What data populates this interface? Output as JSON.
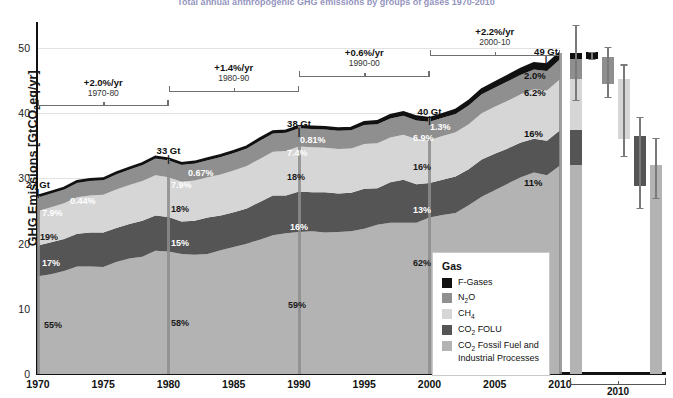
{
  "title": "Total annual anthropogenic GHG emissions by groups of gases 1970-2010",
  "axes": {
    "ylabel": "GHG Emissions [GtCO2eq/yr]",
    "ylabel_prefix": "GHG Emissions [GtCO",
    "ylabel_sub": "2",
    "ylabel_suffix": "eq/yr]",
    "yticks": [
      0,
      10,
      20,
      30,
      40,
      50
    ],
    "ylim": [
      0,
      54
    ],
    "xticks": [
      "1970",
      "1975",
      "1980",
      "1985",
      "1990",
      "1995",
      "2000",
      "2005",
      "2010"
    ],
    "xlim": [
      1970,
      2010
    ]
  },
  "legend": {
    "title": "Gas",
    "items": [
      {
        "label": "F-Gases",
        "sub": "",
        "tail": "",
        "color": "#111111"
      },
      {
        "label": "N",
        "sub": "2",
        "tail": "O",
        "color": "#8f8f8f"
      },
      {
        "label": "CH",
        "sub": "4",
        "tail": "",
        "color": "#d6d6d6"
      },
      {
        "label": "CO",
        "sub": "2",
        "tail": " FOLU",
        "color": "#555555"
      },
      {
        "label": "CO",
        "sub": "2",
        "tail": " Fossil Fuel and Industrial Processes",
        "color": "#b3b3b3"
      }
    ]
  },
  "growth_brackets": [
    {
      "rate": "+2.0%/yr",
      "period": "1970-80",
      "x0": 1970,
      "x1": 1980
    },
    {
      "rate": "+1.4%/yr",
      "period": "1980-90",
      "x0": 1980,
      "x1": 1990
    },
    {
      "rate": "+0.6%/yr",
      "period": "1990-00",
      "x0": 1990,
      "x1": 2000
    },
    {
      "rate": "+2.2%/yr",
      "period": "2000-10",
      "x0": 2000,
      "x1": 2010
    }
  ],
  "milestones": [
    {
      "year": 1970,
      "total": "27 Gt",
      "shares": [
        "7.9%",
        "19%",
        "17%",
        "55%"
      ],
      "extra": "0.44%"
    },
    {
      "year": 1980,
      "total": "33 Gt",
      "shares": [
        "7.9%",
        "18%",
        "15%",
        "58%"
      ],
      "extra": "0.67%"
    },
    {
      "year": 1990,
      "total": "38 Gt",
      "shares": [
        "7.4%",
        "18%",
        "16%",
        "59%"
      ],
      "extra": "0.81%"
    },
    {
      "year": 2000,
      "total": "40 Gt",
      "shares": [
        "6.9%",
        "16%",
        "13%",
        "62%"
      ],
      "extra": "1.3%"
    },
    {
      "year": 2010,
      "total": "49 Gt",
      "shares": [
        "6.2%",
        "16%",
        "11%",
        "65%"
      ],
      "extra": "2.0%"
    }
  ],
  "edge_labels_2010": [
    "2.0%",
    "6.2%",
    "16%",
    "11%",
    "65%"
  ],
  "right_panel": {
    "axis_label": "2010",
    "bars": [
      {
        "name": "total-2010",
        "type": "stacked",
        "bottom": 0,
        "segments": [
          {
            "gas": "CO2 Fossil Fuel and Industrial Processes",
            "value": 32.0,
            "color": "#b3b3b3"
          },
          {
            "gas": "CO2 FOLU",
            "value": 5.4,
            "color": "#555555"
          },
          {
            "gas": "CH4",
            "value": 7.8,
            "color": "#d6d6d6"
          },
          {
            "gas": "N2O",
            "value": 3.1,
            "color": "#8f8f8f"
          },
          {
            "gas": "F-Gases",
            "value": 1.0,
            "color": "#111111"
          }
        ],
        "error": {
          "low": 42.0,
          "high": 53.5
        }
      },
      {
        "name": "f-gases-2010",
        "type": "floating",
        "color": "#111111",
        "low": 48.3,
        "high": 49.4,
        "error": {
          "low": 48.3,
          "high": 49.4
        }
      },
      {
        "name": "n2o-2010",
        "type": "floating",
        "color": "#8f8f8f",
        "low": 44.5,
        "high": 48.6,
        "error": {
          "low": 42.5,
          "high": 50.2
        }
      },
      {
        "name": "ch4-2010",
        "type": "floating",
        "color": "#d6d6d6",
        "low": 36.0,
        "high": 45.2,
        "error": {
          "low": 33.5,
          "high": 47.5
        }
      },
      {
        "name": "co2-folu-2010",
        "type": "floating",
        "color": "#555555",
        "low": 28.8,
        "high": 36.5,
        "error": {
          "low": 25.5,
          "high": 39.5
        }
      },
      {
        "name": "co2-fossil-2010",
        "type": "floating",
        "color": "#b3b3b3",
        "low": 0,
        "high": 32.0,
        "error": {
          "low": 27.0,
          "high": 36.2
        }
      }
    ]
  },
  "chart_data": {
    "type": "area",
    "title": "Total annual anthropogenic GHG emissions by groups of gases 1970-2010",
    "xlabel": "",
    "ylabel": "GHG Emissions [GtCO2eq/yr]",
    "ylim": [
      0,
      54
    ],
    "xlim": [
      1970,
      2010
    ],
    "grid": true,
    "legend_position": "inside-lower-right",
    "stack_order_bottom_to_top": [
      "CO2 Fossil Fuel and Industrial Processes",
      "CO2 FOLU",
      "CH4",
      "N2O",
      "F-Gases"
    ],
    "colors": {
      "CO2 Fossil Fuel and Industrial Processes": "#b3b3b3",
      "CO2 FOLU": "#555555",
      "CH4": "#d6d6d6",
      "N2O": "#8f8f8f",
      "F-Gases": "#111111"
    },
    "x": [
      1970,
      1971,
      1972,
      1973,
      1974,
      1975,
      1976,
      1977,
      1978,
      1979,
      1980,
      1981,
      1982,
      1983,
      1984,
      1985,
      1986,
      1987,
      1988,
      1989,
      1990,
      1991,
      1992,
      1993,
      1994,
      1995,
      1996,
      1997,
      1998,
      1999,
      2000,
      2001,
      2002,
      2003,
      2004,
      2005,
      2006,
      2007,
      2008,
      2009,
      2010
    ],
    "series": [
      {
        "name": "CO2 Fossil Fuel and Industrial Processes",
        "values": [
          15.0,
          15.3,
          15.8,
          16.5,
          16.5,
          16.4,
          17.2,
          17.7,
          18.0,
          18.9,
          18.8,
          18.4,
          18.3,
          18.4,
          19.0,
          19.5,
          20.0,
          20.6,
          21.3,
          21.6,
          21.8,
          21.9,
          21.7,
          21.8,
          21.9,
          22.3,
          22.9,
          23.2,
          23.2,
          23.2,
          24.0,
          24.4,
          24.7,
          25.9,
          27.2,
          28.2,
          29.2,
          30.2,
          30.9,
          30.5,
          32.0
        ]
      },
      {
        "name": "CO2 FOLU",
        "values": [
          4.7,
          4.9,
          4.9,
          5.0,
          5.2,
          5.3,
          5.2,
          5.3,
          5.5,
          5.4,
          5.3,
          5.0,
          5.2,
          5.6,
          5.3,
          5.3,
          5.4,
          5.8,
          6.1,
          5.8,
          6.2,
          6.0,
          6.2,
          5.9,
          5.9,
          6.1,
          5.6,
          6.2,
          6.6,
          5.9,
          5.3,
          5.4,
          5.6,
          5.5,
          5.7,
          5.6,
          5.4,
          5.3,
          5.2,
          5.3,
          5.4
        ]
      },
      {
        "name": "CH4",
        "values": [
          5.3,
          5.4,
          5.5,
          5.6,
          5.7,
          5.8,
          5.9,
          6.0,
          6.1,
          6.2,
          6.1,
          6.1,
          6.2,
          6.2,
          6.3,
          6.4,
          6.5,
          6.6,
          6.7,
          6.8,
          6.9,
          6.9,
          6.8,
          6.8,
          6.8,
          6.9,
          6.9,
          6.9,
          6.9,
          6.9,
          6.6,
          6.7,
          6.8,
          6.9,
          7.1,
          7.2,
          7.3,
          7.4,
          7.6,
          7.7,
          7.8
        ]
      },
      {
        "name": "N2O",
        "values": [
          2.2,
          2.2,
          2.2,
          2.3,
          2.3,
          2.3,
          2.4,
          2.4,
          2.5,
          2.6,
          2.6,
          2.6,
          2.6,
          2.6,
          2.7,
          2.7,
          2.7,
          2.8,
          2.8,
          2.8,
          2.8,
          2.8,
          2.8,
          2.8,
          2.8,
          2.9,
          2.9,
          2.9,
          2.9,
          2.9,
          2.8,
          2.8,
          2.8,
          2.9,
          2.9,
          2.9,
          3.0,
          3.0,
          3.0,
          3.0,
          3.1
        ]
      },
      {
        "name": "F-Gases",
        "values": [
          0.12,
          0.13,
          0.14,
          0.15,
          0.16,
          0.17,
          0.18,
          0.19,
          0.2,
          0.21,
          0.22,
          0.23,
          0.24,
          0.25,
          0.26,
          0.27,
          0.28,
          0.29,
          0.3,
          0.31,
          0.31,
          0.32,
          0.33,
          0.34,
          0.35,
          0.4,
          0.45,
          0.5,
          0.55,
          0.58,
          0.52,
          0.55,
          0.6,
          0.65,
          0.72,
          0.78,
          0.84,
          0.9,
          0.95,
          0.97,
          1.0
        ]
      }
    ],
    "totals_labeled": {
      "1970": 27,
      "1980": 33,
      "1990": 38,
      "2000": 40,
      "2010": 49
    },
    "growth_rates": {
      "1970-80": "+2.0%/yr",
      "1980-90": "+1.4%/yr",
      "1990-00": "+0.6%/yr",
      "2000-10": "+2.2%/yr"
    }
  }
}
